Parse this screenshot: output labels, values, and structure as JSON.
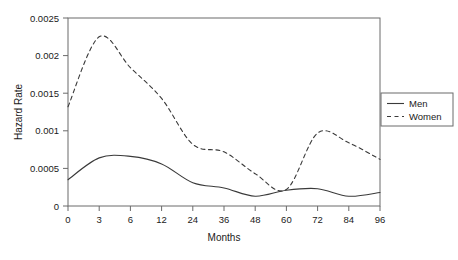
{
  "chart_data": {
    "type": "line",
    "title": "",
    "xlabel": "Months",
    "ylabel": "Hazard Rate",
    "xlim": [
      0,
      96
    ],
    "ylim": [
      0,
      0.0025
    ],
    "grid": false,
    "legend_position": "upper-right",
    "x_tick_labels": [
      "0",
      "3",
      "6",
      "12",
      "24",
      "36",
      "48",
      "60",
      "72",
      "84",
      "96"
    ],
    "x_tick_values": [
      0,
      3,
      6,
      12,
      24,
      36,
      48,
      60,
      72,
      84,
      96
    ],
    "x_axis_scale": "categorical-even-spacing",
    "y_tick_labels": [
      "0",
      "0.0005",
      "0.001",
      "0.0015",
      "0.002",
      "0.0025"
    ],
    "y_tick_values": [
      0,
      0.0005,
      0.001,
      0.0015,
      0.002,
      0.0025
    ],
    "series": [
      {
        "name": "Men",
        "style": "solid",
        "color": "#3a3a3a",
        "x": [
          0,
          3,
          6,
          12,
          24,
          36,
          48,
          60,
          72,
          84,
          96
        ],
        "values": [
          0.00035,
          0.00064,
          0.00066,
          0.00056,
          0.00031,
          0.00024,
          0.00013,
          0.00021,
          0.00023,
          0.00013,
          0.00018
        ]
      },
      {
        "name": "Women",
        "style": "dashed",
        "color": "#3a3a3a",
        "x": [
          0,
          3,
          6,
          12,
          24,
          36,
          48,
          60,
          72,
          84,
          96
        ],
        "values": [
          0.00132,
          0.00225,
          0.00184,
          0.00143,
          0.00082,
          0.00072,
          0.00043,
          0.00022,
          0.00097,
          0.00084,
          0.00062
        ]
      }
    ]
  },
  "legend": {
    "entries": [
      {
        "label": "Men",
        "style": "solid"
      },
      {
        "label": "Women",
        "style": "dashed"
      }
    ]
  },
  "axes": {
    "x_title": "Months",
    "y_title": "Hazard Rate"
  }
}
